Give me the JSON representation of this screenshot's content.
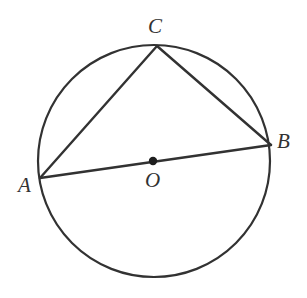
{
  "figure": {
    "background_color": "#ffffff",
    "stroke_color": "#323232",
    "label_color": "#323232"
  },
  "circle": {
    "name": "circumscribed-circle",
    "center_x": 154,
    "center_y": 161,
    "radius": 116,
    "stroke_width": 2.2
  },
  "center_dot": {
    "name": "center-point-O",
    "x": 153,
    "y": 161,
    "radius": 4.2
  },
  "points": [
    {
      "id": "A",
      "label": "A",
      "x": 40,
      "y": 178,
      "label_x": 18,
      "label_y": 175
    },
    {
      "id": "B",
      "label": "B",
      "x": 271,
      "y": 145,
      "label_x": 277,
      "label_y": 131
    },
    {
      "id": "C",
      "label": "C",
      "x": 157,
      "y": 46,
      "label_x": 148,
      "label_y": 16
    },
    {
      "id": "O",
      "label": "O",
      "x": 153,
      "y": 161,
      "label_x": 145,
      "label_y": 170
    }
  ],
  "segments": [
    {
      "id": "AB",
      "name": "diameter-AB",
      "from": "A",
      "to": "B",
      "x1": 40,
      "y1": 178,
      "x2": 271,
      "y2": 145,
      "stroke_width": 2.4
    },
    {
      "id": "AC",
      "name": "chord-AC",
      "from": "A",
      "to": "C",
      "x1": 40,
      "y1": 178,
      "x2": 157,
      "y2": 46,
      "stroke_width": 2.4
    },
    {
      "id": "CB",
      "name": "chord-CB",
      "from": "C",
      "to": "B",
      "x1": 157,
      "y1": 46,
      "x2": 271,
      "y2": 145,
      "stroke_width": 2.4
    }
  ],
  "labels": {
    "A": "A",
    "B": "B",
    "C": "C",
    "O": "O"
  }
}
